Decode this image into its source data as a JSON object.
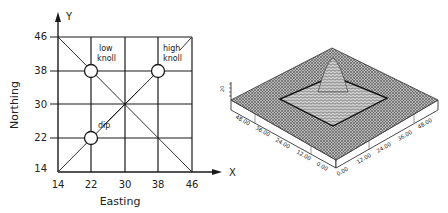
{
  "left_panel": {
    "x_axis_label": "Easting",
    "y_axis_label": "Northing",
    "x_arrow_label": "X",
    "y_arrow_label": "Y",
    "x_ticks": [
      "14",
      "22",
      "30",
      "38",
      "46"
    ],
    "y_ticks": [
      "46",
      "38",
      "30",
      "22",
      "14"
    ],
    "annotations": {
      "low_knoll_line1": "low",
      "low_knoll_line2": "knoll",
      "high_knoll_line1": "high",
      "high_knoll_line2": "knoll",
      "dip": "dip"
    },
    "features": [
      {
        "name": "low knoll",
        "easting": 22,
        "northing": 38
      },
      {
        "name": "high knoll",
        "easting": 38,
        "northing": 38
      },
      {
        "name": "dip",
        "easting": 22,
        "northing": 22
      }
    ]
  },
  "right_panel": {
    "type": "3d-surface-wireframe",
    "left_axis_ticks": [
      "48.00",
      "36.00",
      "24.00",
      "12.00",
      "0.00"
    ],
    "right_axis_ticks": [
      "0.00",
      "12.00",
      "24.00",
      "36.00",
      "48.00"
    ],
    "vertical_axis_tick": "20"
  },
  "colors": {
    "line": "#1a1a1a",
    "surface": "#8a8a8a",
    "background": "#ffffff"
  }
}
